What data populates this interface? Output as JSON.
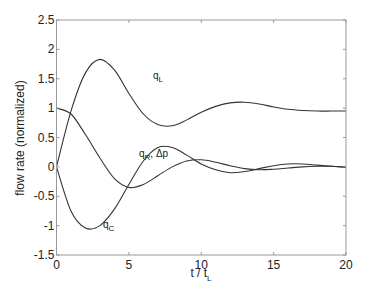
{
  "chart_data": {
    "type": "line",
    "title": "",
    "xlabel": "t / t_L",
    "xlabel_main": "t / t",
    "xlabel_sub": "L",
    "ylabel": "flow rate (normalized)",
    "xlim": [
      0,
      20
    ],
    "ylim": [
      -1.5,
      2.5
    ],
    "grid": false,
    "legend": "none (inline curve labels)",
    "x_ticks": [
      "0",
      "5",
      "10",
      "15",
      "20"
    ],
    "y_ticks": [
      "-1.5",
      "-1",
      "-0.5",
      "0",
      "0.5",
      "1",
      "1.5",
      "2",
      "2.5"
    ],
    "x": [
      0,
      1,
      2,
      3,
      4,
      5,
      6,
      7,
      8,
      9,
      10,
      11,
      12,
      13,
      14,
      15,
      16,
      17,
      18,
      19,
      20
    ],
    "series": [
      {
        "name": "q_L",
        "label_main": "q",
        "label_sub": "L",
        "values": [
          0,
          0.95,
          1.6,
          1.83,
          1.65,
          1.25,
          0.9,
          0.72,
          0.7,
          0.8,
          0.93,
          1.03,
          1.09,
          1.1,
          1.07,
          1.02,
          0.98,
          0.96,
          0.95,
          0.95,
          0.95
        ]
      },
      {
        "name": "q_R, Δp",
        "label_main": "q",
        "label_sub": "R",
        "label_suffix": ", Δp",
        "values": [
          1,
          0.9,
          0.55,
          0.15,
          -0.2,
          -0.35,
          -0.3,
          -0.15,
          0.0,
          0.1,
          0.12,
          0.08,
          0.02,
          -0.03,
          -0.05,
          -0.04,
          -0.02,
          0.0,
          0.01,
          0.01,
          0.0
        ]
      },
      {
        "name": "q_C",
        "label_main": "q",
        "label_sub": "C",
        "values": [
          0,
          -0.75,
          -1.04,
          -1.0,
          -0.72,
          -0.3,
          0.1,
          0.33,
          0.33,
          0.2,
          0.05,
          -0.05,
          -0.1,
          -0.08,
          -0.03,
          0.02,
          0.05,
          0.05,
          0.03,
          0.01,
          -0.01
        ]
      }
    ],
    "line_color": "#333333",
    "axis_color": "#9a9a9a"
  }
}
